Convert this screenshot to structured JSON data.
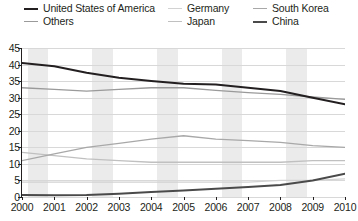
{
  "legend": {
    "items": [
      {
        "label": "United States of America",
        "color": "#231f20",
        "width": 2.0,
        "col": 0,
        "row": 0
      },
      {
        "label": "Others",
        "color": "#9a9a9a",
        "width": 1.3,
        "col": 0,
        "row": 1
      },
      {
        "label": "Germany",
        "color": "#d2d2d2",
        "width": 1.3,
        "col": 1,
        "row": 0
      },
      {
        "label": "Japan",
        "color": "#c0c0c0",
        "width": 1.3,
        "col": 1,
        "row": 1
      },
      {
        "label": "South Korea",
        "color": "#a8a8a8",
        "width": 1.3,
        "col": 2,
        "row": 0
      },
      {
        "label": "China",
        "color": "#4a4a4a",
        "width": 2.0,
        "col": 2,
        "row": 1
      }
    ]
  },
  "chart_data": {
    "type": "line",
    "title": "",
    "subtitle": "",
    "xlabel": "",
    "ylabel": "",
    "x": [
      "2000",
      "2001",
      "2002",
      "2003",
      "2004",
      "2005",
      "2006",
      "2007",
      "2008",
      "2009",
      "2010"
    ],
    "xticklabels": [
      "2000",
      "2001",
      "2002",
      "2003",
      "2004",
      "2005",
      "2006",
      "2007",
      "2008",
      "2009",
      "2010"
    ],
    "yticklabels": [
      "0",
      "5",
      "10",
      "15",
      "20",
      "25",
      "30",
      "35",
      "40",
      "45"
    ],
    "yticks": [
      0,
      5,
      10,
      15,
      20,
      25,
      30,
      35,
      40,
      45
    ],
    "ylim": [
      0,
      45
    ],
    "grid": "horizontal",
    "band_shading": true,
    "legend_position": "top",
    "series": [
      {
        "name": "United States of America",
        "color": "#231f20",
        "width": 2.0,
        "values": [
          40.5,
          39.5,
          37.5,
          36.0,
          35.0,
          34.2,
          34.0,
          33.0,
          32.0,
          30.0,
          28.0
        ]
      },
      {
        "name": "Others",
        "color": "#9a9a9a",
        "width": 1.3,
        "values": [
          33.0,
          32.5,
          32.0,
          32.5,
          33.0,
          33.0,
          32.2,
          31.5,
          31.0,
          30.2,
          29.5
        ]
      },
      {
        "name": "South Korea",
        "color": "#a8a8a8",
        "width": 1.3,
        "values": [
          11.0,
          13.0,
          15.0,
          16.2,
          17.5,
          18.5,
          17.5,
          17.0,
          16.5,
          15.5,
          15.0
        ]
      },
      {
        "name": "Japan",
        "color": "#c0c0c0",
        "width": 1.3,
        "values": [
          13.5,
          12.5,
          11.5,
          11.0,
          10.5,
          10.5,
          10.5,
          10.5,
          10.5,
          11.0,
          11.0
        ]
      },
      {
        "name": "Germany",
        "color": "#d2d2d2",
        "width": 1.3,
        "values": [
          4.5,
          4.5,
          4.5,
          4.5,
          4.5,
          4.5,
          4.5,
          4.5,
          5.0,
          5.0,
          5.5
        ]
      },
      {
        "name": "China",
        "color": "#4a4a4a",
        "width": 2.0,
        "values": [
          0.6,
          0.5,
          0.6,
          1.0,
          1.5,
          2.0,
          2.5,
          3.0,
          3.6,
          5.0,
          7.0
        ]
      }
    ]
  }
}
